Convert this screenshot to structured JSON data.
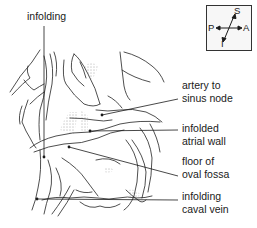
{
  "figure": {
    "top_label": "infolding",
    "labels": [
      {
        "id": "artery",
        "line1": "artery to",
        "line2": "sinus node"
      },
      {
        "id": "atrial",
        "line1": "infolded",
        "line2": "atrial wall"
      },
      {
        "id": "fossa",
        "line1": "floor of",
        "line2": "oval fossa"
      },
      {
        "id": "caval",
        "line1": "infolding",
        "line2": "caval vein"
      }
    ]
  },
  "orientation": {
    "superior": "S",
    "inferior": "I",
    "posterior": "P",
    "anterior": "A"
  },
  "colors": {
    "ink": "#1a1a1a",
    "background": "#ffffff",
    "box_fill": "#f7f7f7"
  }
}
